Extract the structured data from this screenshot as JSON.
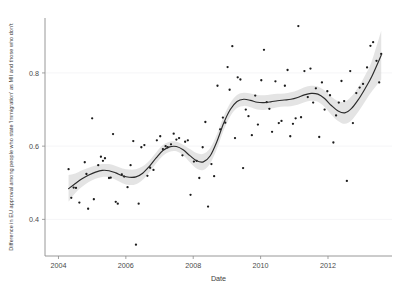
{
  "chart_data": {
    "type": "scatter",
    "title": "",
    "subtitle": "",
    "xlabel": "Date",
    "ylabel": "Difference in EU approval among people who state 'Immigration' as MII and those who don't",
    "xlim": [
      2003.6,
      2013.9
    ],
    "ylim": [
      0.3,
      0.95
    ],
    "xticks": [
      2004,
      2006,
      2008,
      2010,
      2012
    ],
    "xtick_labels": [
      "2004",
      "2006",
      "2008",
      "2010",
      "2012"
    ],
    "yticks": [
      0.4,
      0.6,
      0.8
    ],
    "ytick_labels": [
      "0.4",
      "0.6",
      "0.8"
    ],
    "grid": "horizontal-faint",
    "legend": "none",
    "colors": {
      "point": "#1c1c1c",
      "line": "#2b2b2b",
      "band": "#d4d4d4",
      "axis": "#8c8c8c",
      "grid": "#f4f4f6",
      "background": "#ffffff"
    },
    "series": [
      {
        "name": "Observations",
        "marker": "point",
        "points": [
          [
            2004.3,
            0.537
          ],
          [
            2004.38,
            0.459
          ],
          [
            2004.45,
            0.487
          ],
          [
            2004.52,
            0.486
          ],
          [
            2004.62,
            0.446
          ],
          [
            2004.78,
            0.556
          ],
          [
            2004.83,
            0.524
          ],
          [
            2004.88,
            0.429
          ],
          [
            2005.0,
            0.676
          ],
          [
            2005.05,
            0.455
          ],
          [
            2005.18,
            0.548
          ],
          [
            2005.26,
            0.571
          ],
          [
            2005.32,
            0.56
          ],
          [
            2005.38,
            0.567
          ],
          [
            2005.5,
            0.513
          ],
          [
            2005.55,
            0.514
          ],
          [
            2005.62,
            0.633
          ],
          [
            2005.7,
            0.448
          ],
          [
            2005.76,
            0.443
          ],
          [
            2005.88,
            0.523
          ],
          [
            2005.95,
            0.517
          ],
          [
            2006.05,
            0.488
          ],
          [
            2006.14,
            0.548
          ],
          [
            2006.22,
            0.614
          ],
          [
            2006.3,
            0.331
          ],
          [
            2006.38,
            0.443
          ],
          [
            2006.46,
            0.597
          ],
          [
            2006.55,
            0.603
          ],
          [
            2006.64,
            0.519
          ],
          [
            2006.72,
            0.541
          ],
          [
            2006.82,
            0.535
          ],
          [
            2006.92,
            0.616
          ],
          [
            2007.02,
            0.627
          ],
          [
            2007.1,
            0.592
          ],
          [
            2007.18,
            0.6
          ],
          [
            2007.24,
            0.597
          ],
          [
            2007.34,
            0.605
          ],
          [
            2007.42,
            0.634
          ],
          [
            2007.5,
            0.618
          ],
          [
            2007.58,
            0.622
          ],
          [
            2007.68,
            0.575
          ],
          [
            2007.76,
            0.612
          ],
          [
            2007.84,
            0.616
          ],
          [
            2007.92,
            0.467
          ],
          [
            2008.02,
            0.558
          ],
          [
            2008.1,
            0.56
          ],
          [
            2008.18,
            0.513
          ],
          [
            2008.28,
            0.597
          ],
          [
            2008.36,
            0.666
          ],
          [
            2008.44,
            0.435
          ],
          [
            2008.54,
            0.551
          ],
          [
            2008.62,
            0.518
          ],
          [
            2008.72,
            0.765
          ],
          [
            2008.8,
            0.646
          ],
          [
            2008.88,
            0.678
          ],
          [
            2008.95,
            0.664
          ],
          [
            2009.02,
            0.816
          ],
          [
            2009.08,
            0.754
          ],
          [
            2009.16,
            0.873
          ],
          [
            2009.24,
            0.622
          ],
          [
            2009.32,
            0.788
          ],
          [
            2009.4,
            0.782
          ],
          [
            2009.48,
            0.54
          ],
          [
            2009.56,
            0.7
          ],
          [
            2009.64,
            0.682
          ],
          [
            2009.74,
            0.63
          ],
          [
            2009.84,
            0.738
          ],
          [
            2009.92,
            0.659
          ],
          [
            2010.02,
            0.78
          ],
          [
            2010.1,
            0.863
          ],
          [
            2010.18,
            0.72
          ],
          [
            2010.26,
            0.702
          ],
          [
            2010.34,
            0.639
          ],
          [
            2010.44,
            0.777
          ],
          [
            2010.54,
            0.663
          ],
          [
            2010.62,
            0.669
          ],
          [
            2010.72,
            0.765
          ],
          [
            2010.8,
            0.808
          ],
          [
            2010.88,
            0.627
          ],
          [
            2010.96,
            0.661
          ],
          [
            2011.04,
            0.676
          ],
          [
            2011.12,
            0.928
          ],
          [
            2011.2,
            0.679
          ],
          [
            2011.3,
            0.805
          ],
          [
            2011.4,
            0.734
          ],
          [
            2011.48,
            0.812
          ],
          [
            2011.56,
            0.719
          ],
          [
            2011.64,
            0.758
          ],
          [
            2011.74,
            0.625
          ],
          [
            2011.82,
            0.774
          ],
          [
            2011.9,
            0.7
          ],
          [
            2011.98,
            0.75
          ],
          [
            2012.06,
            0.739
          ],
          [
            2012.16,
            0.61
          ],
          [
            2012.24,
            0.684
          ],
          [
            2012.32,
            0.719
          ],
          [
            2012.4,
            0.778
          ],
          [
            2012.48,
            0.723
          ],
          [
            2012.56,
            0.505
          ],
          [
            2012.66,
            0.805
          ],
          [
            2012.74,
            0.663
          ],
          [
            2012.84,
            0.745
          ],
          [
            2012.94,
            0.76
          ],
          [
            2013.04,
            0.77
          ],
          [
            2013.16,
            0.815
          ],
          [
            2013.26,
            0.874
          ],
          [
            2013.34,
            0.884
          ],
          [
            2013.44,
            0.833
          ],
          [
            2013.52,
            0.774
          ],
          [
            2013.58,
            0.852
          ]
        ]
      }
    ],
    "smooth": {
      "name": "LOESS fit with 95% confidence band",
      "x": [
        2004.3,
        2004.5,
        2004.7,
        2004.9,
        2005.1,
        2005.3,
        2005.5,
        2005.7,
        2005.9,
        2006.1,
        2006.3,
        2006.5,
        2006.7,
        2006.9,
        2007.1,
        2007.3,
        2007.5,
        2007.7,
        2007.9,
        2008.1,
        2008.3,
        2008.5,
        2008.7,
        2008.9,
        2009.1,
        2009.3,
        2009.5,
        2009.7,
        2009.9,
        2010.1,
        2010.3,
        2010.5,
        2010.7,
        2010.9,
        2011.1,
        2011.3,
        2011.5,
        2011.7,
        2011.9,
        2012.1,
        2012.3,
        2012.5,
        2012.7,
        2012.9,
        2013.1,
        2013.3,
        2013.58
      ],
      "y": [
        0.484,
        0.498,
        0.511,
        0.521,
        0.529,
        0.534,
        0.533,
        0.527,
        0.519,
        0.515,
        0.516,
        0.526,
        0.545,
        0.568,
        0.588,
        0.598,
        0.599,
        0.59,
        0.574,
        0.56,
        0.557,
        0.573,
        0.612,
        0.662,
        0.7,
        0.722,
        0.728,
        0.725,
        0.72,
        0.719,
        0.721,
        0.724,
        0.726,
        0.728,
        0.733,
        0.74,
        0.744,
        0.742,
        0.73,
        0.711,
        0.696,
        0.691,
        0.703,
        0.727,
        0.757,
        0.79,
        0.848
      ],
      "lower": [
        0.448,
        0.472,
        0.489,
        0.502,
        0.511,
        0.516,
        0.515,
        0.508,
        0.499,
        0.494,
        0.496,
        0.508,
        0.529,
        0.553,
        0.574,
        0.585,
        0.586,
        0.575,
        0.556,
        0.539,
        0.535,
        0.552,
        0.592,
        0.643,
        0.682,
        0.704,
        0.71,
        0.706,
        0.7,
        0.699,
        0.702,
        0.706,
        0.708,
        0.709,
        0.713,
        0.72,
        0.724,
        0.721,
        0.707,
        0.686,
        0.669,
        0.661,
        0.671,
        0.694,
        0.722,
        0.749,
        0.782
      ],
      "upper": [
        0.521,
        0.525,
        0.534,
        0.541,
        0.547,
        0.551,
        0.551,
        0.546,
        0.539,
        0.536,
        0.537,
        0.545,
        0.561,
        0.583,
        0.603,
        0.612,
        0.612,
        0.604,
        0.592,
        0.581,
        0.579,
        0.594,
        0.632,
        0.681,
        0.718,
        0.74,
        0.746,
        0.744,
        0.74,
        0.739,
        0.741,
        0.743,
        0.744,
        0.747,
        0.753,
        0.761,
        0.765,
        0.763,
        0.752,
        0.735,
        0.723,
        0.721,
        0.736,
        0.761,
        0.793,
        0.832,
        0.915
      ]
    }
  }
}
